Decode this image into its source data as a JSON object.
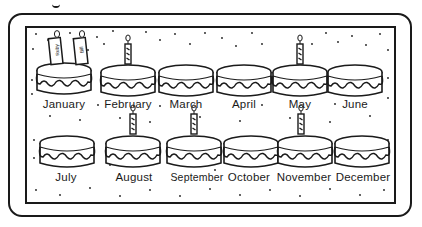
{
  "chart_title": "Birthday calendar",
  "colors": {
    "ink": "#1a1a1a",
    "background": "#ffffff"
  },
  "months": [
    {
      "name": "January",
      "candles": [
        "Ruby",
        "Bill"
      ]
    },
    {
      "name": "February",
      "candles": [
        ""
      ]
    },
    {
      "name": "March",
      "candles": []
    },
    {
      "name": "April",
      "candles": []
    },
    {
      "name": "May",
      "candles": [
        ""
      ]
    },
    {
      "name": "June",
      "candles": []
    },
    {
      "name": "July",
      "candles": []
    },
    {
      "name": "August",
      "candles": [
        ""
      ]
    },
    {
      "name": "September",
      "candles": [
        ""
      ]
    },
    {
      "name": "October",
      "candles": []
    },
    {
      "name": "November",
      "candles": [
        ""
      ]
    },
    {
      "name": "December",
      "candles": []
    }
  ],
  "labels": {
    "m0": "January",
    "m1": "February",
    "m2": "March",
    "m3": "April",
    "m4": "May",
    "m5": "June",
    "m6": "July",
    "m7": "August",
    "m8": "September",
    "m9": "October",
    "m10": "November",
    "m11": "December",
    "c_jan_1": "Ruby",
    "c_jan_2": "Bill"
  }
}
